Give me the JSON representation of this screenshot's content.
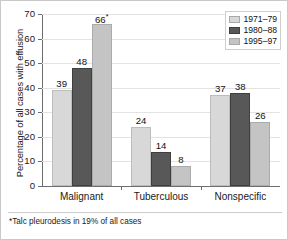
{
  "chart_data": {
    "type": "bar",
    "title": "",
    "xlabel": "",
    "ylabel": "Percentage of all cases with effusion",
    "ylim": [
      0,
      70
    ],
    "yticks": [
      0,
      10,
      20,
      30,
      40,
      50,
      60,
      70
    ],
    "ytick_labels": [
      "0",
      "10",
      "20",
      "30",
      "40",
      "50",
      "60",
      "70"
    ],
    "grid": true,
    "legend_position": "top-right",
    "categories": [
      "Malignant",
      "Tuberculous",
      "Nonspecific"
    ],
    "series": [
      {
        "name": "1971–79",
        "color": "#d8d8d8",
        "values": [
          39,
          24,
          37
        ],
        "labels": [
          "39",
          "24",
          "37"
        ]
      },
      {
        "name": "1980–88",
        "color": "#585858",
        "values": [
          48,
          14,
          38
        ],
        "labels": [
          "48",
          "14",
          "38"
        ]
      },
      {
        "name": "1995–97",
        "color": "#c4c4c4",
        "values": [
          66,
          8,
          26
        ],
        "labels": [
          "66",
          "8",
          "26"
        ]
      }
    ],
    "annotations": [
      {
        "series": "1995–97",
        "category": "Malignant",
        "marker": "*",
        "note": "Talc pleurodesis in 19% of all cases"
      }
    ],
    "footnote": "*Talc pleurodesis in 19% of all cases"
  },
  "axis": {
    "y_title": "Percentage of all cases with effusion",
    "y_ticks": [
      "70",
      "60",
      "50",
      "40",
      "30",
      "20",
      "10",
      "0"
    ]
  },
  "legend": {
    "entries": [
      {
        "label": "1971–79"
      },
      {
        "label": "1980–88"
      },
      {
        "label": "1995–97"
      }
    ]
  },
  "categories": [
    {
      "label": "Malignant"
    },
    {
      "label": "Tuberculous"
    },
    {
      "label": "Nonspecific"
    }
  ],
  "values": {
    "malignant": {
      "s0": "39",
      "s1": "48",
      "s2": "66",
      "s2_sup": "*"
    },
    "tuberculous": {
      "s0": "24",
      "s1": "14",
      "s2": "8"
    },
    "nonspecific": {
      "s0": "37",
      "s1": "38",
      "s2": "26"
    }
  },
  "footnote": {
    "text": "*Talc pleurodesis in 19% of all cases"
  },
  "colors": {
    "series_1": "#d8d8d8",
    "series_2": "#585858",
    "series_3": "#c4c4c4",
    "axis": "#6e6e6e",
    "grid": "#e3e3e3",
    "frame": "#c9c9c9"
  }
}
